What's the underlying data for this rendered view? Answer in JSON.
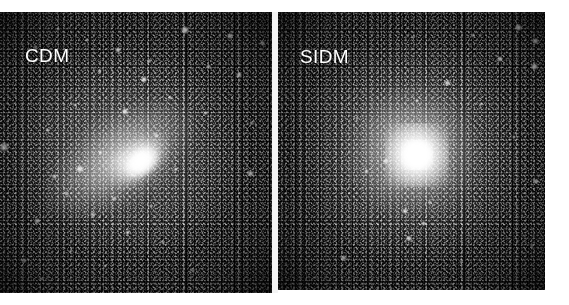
{
  "figure": {
    "kind": "side-by-side-simulation-images",
    "background_color": "#ffffff",
    "width": 569,
    "height": 305
  },
  "panels": [
    {
      "id": "cdm",
      "label": "CDM",
      "label_color": "#ffffff",
      "background_color": "#000000",
      "description": "Cold dark matter halo: elongated triaxial core with abundant bright subhalos",
      "core_shape": "elongated",
      "satellite_count": 38,
      "satellites": [
        {
          "x": 68.0,
          "y": 6.5,
          "r": 2.6,
          "b": 0.95
        },
        {
          "x": 84.5,
          "y": 8.5,
          "r": 1.9,
          "b": 0.8
        },
        {
          "x": 32.0,
          "y": 10.0,
          "r": 1.6,
          "b": 0.62
        },
        {
          "x": 13.0,
          "y": 12.5,
          "r": 1.5,
          "b": 0.58
        },
        {
          "x": 21.5,
          "y": 6.0,
          "r": 1.4,
          "b": 0.55
        },
        {
          "x": 43.5,
          "y": 13.5,
          "r": 2.0,
          "b": 0.78
        },
        {
          "x": 55.0,
          "y": 17.5,
          "r": 1.5,
          "b": 0.6
        },
        {
          "x": 76.5,
          "y": 19.5,
          "r": 1.7,
          "b": 0.66
        },
        {
          "x": 96.5,
          "y": 11.0,
          "r": 1.8,
          "b": 0.72
        },
        {
          "x": 53.0,
          "y": 24.0,
          "r": 2.2,
          "b": 0.84
        },
        {
          "x": 88.0,
          "y": 22.5,
          "r": 2.1,
          "b": 0.8
        },
        {
          "x": 36.5,
          "y": 21.0,
          "r": 1.6,
          "b": 0.6
        },
        {
          "x": 62.5,
          "y": 30.5,
          "r": 1.7,
          "b": 0.64
        },
        {
          "x": 46.0,
          "y": 35.5,
          "r": 2.3,
          "b": 0.86
        },
        {
          "x": 27.5,
          "y": 33.0,
          "r": 1.5,
          "b": 0.56
        },
        {
          "x": 75.5,
          "y": 36.0,
          "r": 1.6,
          "b": 0.6
        },
        {
          "x": 92.5,
          "y": 39.5,
          "r": 1.5,
          "b": 0.56
        },
        {
          "x": 17.5,
          "y": 42.0,
          "r": 1.6,
          "b": 0.6
        },
        {
          "x": 57.5,
          "y": 44.0,
          "r": 1.6,
          "b": 0.62
        },
        {
          "x": 1.5,
          "y": 48.0,
          "r": 3.4,
          "b": 0.7
        },
        {
          "x": 37.0,
          "y": 50.0,
          "r": 1.5,
          "b": 0.58
        },
        {
          "x": 29.5,
          "y": 56.0,
          "r": 2.8,
          "b": 0.78
        },
        {
          "x": 20.0,
          "y": 58.5,
          "r": 1.8,
          "b": 0.64
        },
        {
          "x": 48.5,
          "y": 58.0,
          "r": 1.6,
          "b": 0.6
        },
        {
          "x": 92.0,
          "y": 57.5,
          "r": 2.4,
          "b": 0.72
        },
        {
          "x": 64.5,
          "y": 56.0,
          "r": 1.5,
          "b": 0.55
        },
        {
          "x": 24.5,
          "y": 64.5,
          "r": 1.6,
          "b": 0.58
        },
        {
          "x": 42.0,
          "y": 66.5,
          "r": 1.7,
          "b": 0.62
        },
        {
          "x": 55.5,
          "y": 69.0,
          "r": 1.5,
          "b": 0.54
        },
        {
          "x": 34.0,
          "y": 72.0,
          "r": 1.6,
          "b": 0.58
        },
        {
          "x": 13.5,
          "y": 74.5,
          "r": 2.0,
          "b": 0.66
        },
        {
          "x": 47.0,
          "y": 78.5,
          "r": 1.8,
          "b": 0.62
        },
        {
          "x": 60.0,
          "y": 82.0,
          "r": 1.5,
          "b": 0.52
        },
        {
          "x": 26.0,
          "y": 85.0,
          "r": 1.5,
          "b": 0.52
        },
        {
          "x": 9.0,
          "y": 88.5,
          "r": 1.7,
          "b": 0.58
        },
        {
          "x": 38.5,
          "y": 90.5,
          "r": 1.4,
          "b": 0.48
        },
        {
          "x": 15.5,
          "y": 95.0,
          "r": 1.5,
          "b": 0.5
        },
        {
          "x": 71.0,
          "y": 92.0,
          "r": 1.4,
          "b": 0.46
        }
      ]
    },
    {
      "id": "sidm",
      "label": "SIDM",
      "label_color": "#ffffff",
      "background_color": "#000000",
      "description": "Self-interacting dark matter halo: round compact cored center with fewer subhalos",
      "core_shape": "round",
      "satellite_count": 22,
      "satellites": [
        {
          "x": 90.0,
          "y": 5.5,
          "r": 2.4,
          "b": 0.92
        },
        {
          "x": 96.5,
          "y": 10.5,
          "r": 2.2,
          "b": 0.88
        },
        {
          "x": 73.0,
          "y": 8.5,
          "r": 1.5,
          "b": 0.55
        },
        {
          "x": 50.5,
          "y": 9.0,
          "r": 1.4,
          "b": 0.5
        },
        {
          "x": 83.0,
          "y": 17.0,
          "r": 2.1,
          "b": 0.82
        },
        {
          "x": 96.0,
          "y": 19.5,
          "r": 2.3,
          "b": 0.88
        },
        {
          "x": 63.5,
          "y": 25.5,
          "r": 2.2,
          "b": 0.76
        },
        {
          "x": 52.0,
          "y": 32.0,
          "r": 1.6,
          "b": 0.6
        },
        {
          "x": 76.0,
          "y": 33.0,
          "r": 1.5,
          "b": 0.56
        },
        {
          "x": 29.5,
          "y": 38.0,
          "r": 1.4,
          "b": 0.48
        },
        {
          "x": 88.5,
          "y": 45.0,
          "r": 1.5,
          "b": 0.52
        },
        {
          "x": 40.5,
          "y": 53.5,
          "r": 2.0,
          "b": 0.68
        },
        {
          "x": 33.0,
          "y": 57.5,
          "r": 1.8,
          "b": 0.62
        },
        {
          "x": 96.5,
          "y": 61.0,
          "r": 2.0,
          "b": 0.72
        },
        {
          "x": 57.0,
          "y": 68.5,
          "r": 1.6,
          "b": 0.58
        },
        {
          "x": 47.5,
          "y": 71.5,
          "r": 2.1,
          "b": 0.74
        },
        {
          "x": 54.5,
          "y": 76.0,
          "r": 1.9,
          "b": 0.7
        },
        {
          "x": 49.0,
          "y": 81.5,
          "r": 2.2,
          "b": 0.78
        },
        {
          "x": 24.5,
          "y": 88.5,
          "r": 2.3,
          "b": 0.74
        },
        {
          "x": 95.0,
          "y": 84.0,
          "r": 1.4,
          "b": 0.46
        },
        {
          "x": 68.5,
          "y": 90.0,
          "r": 1.4,
          "b": 0.46
        },
        {
          "x": 14.0,
          "y": 95.5,
          "r": 1.3,
          "b": 0.42
        }
      ]
    }
  ]
}
